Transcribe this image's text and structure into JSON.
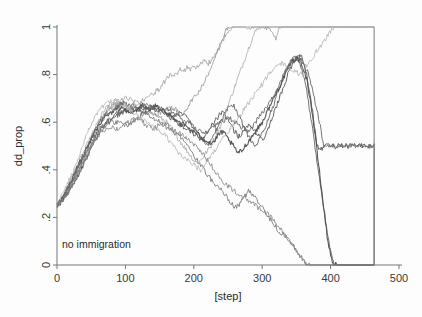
{
  "figure": {
    "background_color": "#fdfdfd",
    "axis_color": "#777777",
    "text_color": "#2b2b2b"
  },
  "annotation": {
    "text": "no immigration"
  },
  "chart_data": {
    "type": "line",
    "title": "",
    "subtitle": "",
    "xlabel": "[step]",
    "ylabel": "dd_prop",
    "xlim": [
      0,
      500
    ],
    "ylim": [
      0,
      1
    ],
    "xticks": [
      0,
      100,
      200,
      300,
      400,
      500
    ],
    "xtick_labels": [
      "0",
      "100",
      "200",
      "300",
      "400",
      "500"
    ],
    "yticks": [
      0,
      0.2,
      0.4,
      0.6,
      0.8,
      1
    ],
    "ytick_labels": [
      "0",
      ".2",
      ".4",
      ".6",
      ".8",
      "1"
    ],
    "grid": false,
    "legend": false,
    "legend_position": "none",
    "annotations": [
      {
        "text": "no immigration",
        "x": 20,
        "y": 0.1
      }
    ],
    "x_step": 5,
    "series": [
      {
        "name": "run-1",
        "color": "#9a9a9a",
        "width": 0.8,
        "values": [
          0.25,
          0.27,
          0.29,
          0.31,
          0.33,
          0.35,
          0.37,
          0.4,
          0.43,
          0.46,
          0.5,
          0.54,
          0.57,
          0.6,
          0.63,
          0.65,
          0.66,
          0.67,
          0.68,
          0.69,
          0.7,
          0.7,
          0.69,
          0.68,
          0.68,
          0.69,
          0.7,
          0.71,
          0.72,
          0.73,
          0.74,
          0.76,
          0.78,
          0.8,
          0.79,
          0.8,
          0.82,
          0.81,
          0.83,
          0.82,
          0.84,
          0.83,
          0.85,
          0.86,
          0.84,
          0.86,
          0.88,
          0.9,
          0.93,
          0.96,
          0.98,
          1.0,
          1.0,
          1.0,
          1.0,
          1.0,
          0.99,
          1.0,
          1.0,
          1.0,
          1.0,
          0.99,
          1.0,
          0.98,
          0.95,
          1.0,
          1.0,
          1.0,
          1.0,
          1.0,
          1.0,
          1.0,
          1.0,
          1.0,
          1.0,
          1.0,
          1.0,
          1.0,
          1.0,
          1.0,
          1.0,
          1.0,
          1.0,
          1.0,
          1.0,
          1.0,
          1.0,
          1.0,
          1.0,
          1.0,
          1.0,
          1.0,
          1.0
        ]
      },
      {
        "name": "run-2",
        "color": "#8e8e8e",
        "width": 0.8,
        "values": [
          0.25,
          0.27,
          0.28,
          0.3,
          0.33,
          0.36,
          0.39,
          0.42,
          0.45,
          0.49,
          0.53,
          0.56,
          0.59,
          0.62,
          0.64,
          0.66,
          0.67,
          0.68,
          0.68,
          0.67,
          0.67,
          0.66,
          0.66,
          0.65,
          0.66,
          0.67,
          0.66,
          0.65,
          0.64,
          0.63,
          0.64,
          0.65,
          0.66,
          0.67,
          0.66,
          0.65,
          0.63,
          0.64,
          0.66,
          0.68,
          0.7,
          0.72,
          0.74,
          0.77,
          0.8,
          0.83,
          0.86,
          0.9,
          0.94,
          0.97,
          1.0,
          1.0,
          1.0,
          1.0,
          1.0,
          1.0,
          1.0,
          1.0,
          1.0,
          1.0,
          1.0,
          1.0,
          1.0,
          1.0,
          1.0,
          1.0,
          1.0,
          1.0,
          1.0,
          1.0,
          1.0,
          1.0,
          1.0,
          1.0,
          1.0,
          1.0,
          1.0,
          1.0,
          1.0,
          1.0,
          1.0,
          1.0,
          1.0,
          1.0,
          1.0,
          1.0,
          1.0,
          1.0,
          1.0,
          1.0,
          1.0,
          1.0,
          1.0
        ]
      },
      {
        "name": "run-3",
        "color": "#5d5d5d",
        "width": 1.0,
        "values": [
          0.25,
          0.26,
          0.28,
          0.3,
          0.32,
          0.34,
          0.37,
          0.4,
          0.43,
          0.46,
          0.49,
          0.52,
          0.55,
          0.57,
          0.59,
          0.61,
          0.62,
          0.63,
          0.64,
          0.64,
          0.65,
          0.65,
          0.66,
          0.66,
          0.65,
          0.64,
          0.65,
          0.66,
          0.67,
          0.66,
          0.65,
          0.64,
          0.63,
          0.62,
          0.61,
          0.6,
          0.59,
          0.58,
          0.57,
          0.56,
          0.55,
          0.54,
          0.53,
          0.54,
          0.56,
          0.58,
          0.6,
          0.62,
          0.64,
          0.63,
          0.61,
          0.58,
          0.56,
          0.54,
          0.55,
          0.57,
          0.59,
          0.58,
          0.56,
          0.54,
          0.52,
          0.55,
          0.58,
          0.62,
          0.66,
          0.7,
          0.74,
          0.78,
          0.82,
          0.85,
          0.87,
          0.88,
          0.86,
          0.8,
          0.72,
          0.62,
          0.5,
          0.48,
          0.5,
          0.5,
          0.5,
          0.5,
          0.5,
          0.5,
          0.5,
          0.5,
          0.5,
          0.5,
          0.5,
          0.5,
          0.5,
          0.5,
          0.5
        ]
      },
      {
        "name": "run-4",
        "color": "#6a6a6a",
        "width": 1.0,
        "values": [
          0.25,
          0.27,
          0.29,
          0.31,
          0.34,
          0.37,
          0.4,
          0.43,
          0.46,
          0.49,
          0.52,
          0.54,
          0.56,
          0.58,
          0.59,
          0.6,
          0.61,
          0.62,
          0.63,
          0.64,
          0.65,
          0.66,
          0.67,
          0.67,
          0.66,
          0.65,
          0.64,
          0.65,
          0.66,
          0.67,
          0.66,
          0.65,
          0.64,
          0.63,
          0.62,
          0.63,
          0.64,
          0.63,
          0.62,
          0.6,
          0.58,
          0.56,
          0.54,
          0.52,
          0.5,
          0.52,
          0.55,
          0.58,
          0.61,
          0.64,
          0.66,
          0.68,
          0.66,
          0.63,
          0.6,
          0.57,
          0.54,
          0.52,
          0.5,
          0.52,
          0.55,
          0.58,
          0.62,
          0.66,
          0.7,
          0.74,
          0.78,
          0.81,
          0.84,
          0.86,
          0.87,
          0.85,
          0.8,
          0.73,
          0.64,
          0.54,
          0.44,
          0.34,
          0.24,
          0.14,
          0.06,
          0.0,
          0.0,
          0.0,
          0.0,
          0.0,
          0.0,
          0.0,
          0.0,
          0.0,
          0.0,
          0.0,
          0.0
        ]
      },
      {
        "name": "run-5",
        "color": "#777777",
        "width": 0.9,
        "values": [
          0.25,
          0.26,
          0.28,
          0.3,
          0.32,
          0.35,
          0.38,
          0.41,
          0.44,
          0.47,
          0.5,
          0.53,
          0.55,
          0.57,
          0.58,
          0.59,
          0.6,
          0.6,
          0.6,
          0.6,
          0.59,
          0.59,
          0.6,
          0.61,
          0.62,
          0.63,
          0.64,
          0.63,
          0.62,
          0.61,
          0.6,
          0.59,
          0.58,
          0.57,
          0.56,
          0.55,
          0.54,
          0.52,
          0.5,
          0.48,
          0.46,
          0.44,
          0.42,
          0.4,
          0.38,
          0.36,
          0.34,
          0.33,
          0.32,
          0.3,
          0.28,
          0.26,
          0.24,
          0.25,
          0.27,
          0.29,
          0.31,
          0.3,
          0.28,
          0.26,
          0.24,
          0.22,
          0.2,
          0.18,
          0.16,
          0.14,
          0.13,
          0.12,
          0.1,
          0.08,
          0.06,
          0.04,
          0.02,
          0.0,
          0.0,
          0.0,
          0.0,
          0.0,
          0.0,
          0.0,
          0.0,
          0.0,
          0.0,
          0.0,
          0.0,
          0.0,
          0.0,
          0.0,
          0.0,
          0.0,
          0.0,
          0.0,
          0.0
        ]
      },
      {
        "name": "run-6",
        "color": "#a3a3a3",
        "width": 0.8,
        "values": [
          0.25,
          0.27,
          0.3,
          0.33,
          0.36,
          0.39,
          0.42,
          0.45,
          0.48,
          0.51,
          0.54,
          0.57,
          0.6,
          0.63,
          0.65,
          0.67,
          0.68,
          0.69,
          0.69,
          0.68,
          0.67,
          0.66,
          0.66,
          0.67,
          0.68,
          0.67,
          0.66,
          0.65,
          0.64,
          0.63,
          0.62,
          0.61,
          0.6,
          0.58,
          0.56,
          0.54,
          0.52,
          0.5,
          0.48,
          0.46,
          0.44,
          0.43,
          0.44,
          0.46,
          0.48,
          0.5,
          0.53,
          0.56,
          0.59,
          0.63,
          0.67,
          0.71,
          0.75,
          0.79,
          0.83,
          0.87,
          0.91,
          0.95,
          0.98,
          1.0,
          1.0,
          1.0,
          1.0,
          1.0,
          1.0,
          1.0,
          1.0,
          1.0,
          1.0,
          1.0,
          1.0,
          1.0,
          1.0,
          1.0,
          1.0,
          1.0,
          1.0,
          1.0,
          1.0,
          1.0,
          1.0,
          1.0,
          1.0,
          1.0,
          1.0,
          1.0,
          1.0,
          1.0,
          1.0,
          1.0,
          1.0,
          1.0,
          1.0
        ]
      },
      {
        "name": "run-7",
        "color": "#4f4f4f",
        "width": 1.1,
        "values": [
          0.25,
          0.27,
          0.29,
          0.32,
          0.35,
          0.38,
          0.41,
          0.44,
          0.47,
          0.5,
          0.53,
          0.56,
          0.58,
          0.6,
          0.62,
          0.63,
          0.64,
          0.65,
          0.66,
          0.66,
          0.65,
          0.64,
          0.64,
          0.65,
          0.66,
          0.67,
          0.66,
          0.65,
          0.66,
          0.67,
          0.66,
          0.65,
          0.64,
          0.63,
          0.62,
          0.61,
          0.6,
          0.59,
          0.58,
          0.57,
          0.56,
          0.55,
          0.54,
          0.53,
          0.52,
          0.51,
          0.52,
          0.54,
          0.56,
          0.55,
          0.53,
          0.51,
          0.49,
          0.47,
          0.48,
          0.5,
          0.52,
          0.54,
          0.56,
          0.58,
          0.6,
          0.63,
          0.66,
          0.69,
          0.72,
          0.75,
          0.78,
          0.81,
          0.84,
          0.86,
          0.87,
          0.86,
          0.83,
          0.78,
          0.7,
          0.6,
          0.48,
          0.36,
          0.24,
          0.12,
          0.04,
          0.0,
          0.0,
          0.0,
          0.0,
          0.0,
          0.0,
          0.0,
          0.0,
          0.0,
          0.0,
          0.0,
          0.0
        ]
      },
      {
        "name": "run-8",
        "color": "#b0b0b0",
        "width": 0.8,
        "values": [
          0.25,
          0.28,
          0.31,
          0.34,
          0.37,
          0.4,
          0.44,
          0.48,
          0.52,
          0.56,
          0.59,
          0.62,
          0.64,
          0.66,
          0.67,
          0.68,
          0.69,
          0.69,
          0.68,
          0.67,
          0.66,
          0.65,
          0.64,
          0.63,
          0.62,
          0.61,
          0.6,
          0.59,
          0.58,
          0.57,
          0.56,
          0.55,
          0.54,
          0.52,
          0.5,
          0.48,
          0.46,
          0.45,
          0.44,
          0.43,
          0.42,
          0.41,
          0.4,
          0.42,
          0.44,
          0.46,
          0.48,
          0.5,
          0.52,
          0.54,
          0.56,
          0.58,
          0.6,
          0.62,
          0.64,
          0.66,
          0.68,
          0.7,
          0.72,
          0.74,
          0.76,
          0.78,
          0.8,
          0.82,
          0.83,
          0.84,
          0.85,
          0.84,
          0.83,
          0.82,
          0.81,
          0.8,
          0.82,
          0.84,
          0.86,
          0.88,
          0.9,
          0.92,
          0.94,
          0.96,
          0.98,
          1.0,
          1.0,
          1.0,
          1.0,
          1.0,
          1.0,
          1.0,
          1.0,
          1.0,
          1.0,
          1.0,
          1.0
        ]
      },
      {
        "name": "run-9",
        "color": "#888888",
        "width": 0.9,
        "values": [
          0.25,
          0.26,
          0.28,
          0.3,
          0.33,
          0.36,
          0.39,
          0.42,
          0.45,
          0.48,
          0.5,
          0.52,
          0.54,
          0.56,
          0.57,
          0.58,
          0.58,
          0.57,
          0.57,
          0.58,
          0.59,
          0.6,
          0.61,
          0.62,
          0.61,
          0.6,
          0.59,
          0.58,
          0.57,
          0.58,
          0.59,
          0.6,
          0.59,
          0.58,
          0.57,
          0.56,
          0.55,
          0.54,
          0.53,
          0.52,
          0.51,
          0.5,
          0.48,
          0.46,
          0.44,
          0.42,
          0.4,
          0.38,
          0.36,
          0.34,
          0.33,
          0.32,
          0.31,
          0.3,
          0.29,
          0.28,
          0.27,
          0.26,
          0.25,
          0.24,
          0.23,
          0.22,
          0.21,
          0.2,
          0.18,
          0.16,
          0.14,
          0.12,
          0.1,
          0.08,
          0.06,
          0.04,
          0.02,
          0.0,
          0.0,
          0.0,
          0.0,
          0.0,
          0.0,
          0.0,
          0.0,
          0.0,
          0.0,
          0.0,
          0.0,
          0.0,
          0.0,
          0.0,
          0.0,
          0.0,
          0.0,
          0.0,
          0.0
        ]
      },
      {
        "name": "run-10",
        "color": "#6f6f6f",
        "width": 1.0,
        "values": [
          0.25,
          0.27,
          0.29,
          0.32,
          0.35,
          0.38,
          0.41,
          0.44,
          0.47,
          0.5,
          0.53,
          0.56,
          0.59,
          0.61,
          0.63,
          0.64,
          0.65,
          0.66,
          0.67,
          0.68,
          0.68,
          0.67,
          0.66,
          0.65,
          0.66,
          0.67,
          0.68,
          0.67,
          0.66,
          0.65,
          0.64,
          0.65,
          0.66,
          0.65,
          0.64,
          0.63,
          0.62,
          0.61,
          0.6,
          0.59,
          0.58,
          0.57,
          0.56,
          0.55,
          0.56,
          0.57,
          0.58,
          0.59,
          0.6,
          0.61,
          0.62,
          0.61,
          0.6,
          0.59,
          0.58,
          0.57,
          0.56,
          0.58,
          0.6,
          0.62,
          0.64,
          0.66,
          0.68,
          0.7,
          0.73,
          0.76,
          0.79,
          0.82,
          0.85,
          0.87,
          0.88,
          0.87,
          0.85,
          0.82,
          0.78,
          0.72,
          0.65,
          0.58,
          0.5,
          0.5,
          0.5,
          0.5,
          0.5,
          0.5,
          0.5,
          0.5,
          0.5,
          0.5,
          0.5,
          0.5,
          0.5,
          0.5,
          0.5
        ]
      }
    ]
  }
}
